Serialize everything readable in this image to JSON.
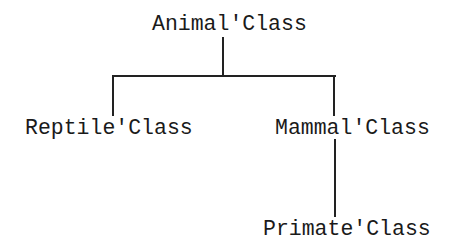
{
  "diagram": {
    "type": "class-hierarchy-tree",
    "nodes": {
      "root": {
        "label": "Animal'Class"
      },
      "left_child": {
        "label": "Reptile'Class"
      },
      "right_child": {
        "label": "Mammal'Class"
      },
      "grandchild": {
        "label": "Primate'Class"
      }
    },
    "edges": [
      {
        "from": "Animal'Class",
        "to": "Reptile'Class"
      },
      {
        "from": "Animal'Class",
        "to": "Mammal'Class"
      },
      {
        "from": "Mammal'Class",
        "to": "Primate'Class"
      }
    ],
    "colors": {
      "background": "#ffffff",
      "ink": "#1a1a1a"
    }
  }
}
